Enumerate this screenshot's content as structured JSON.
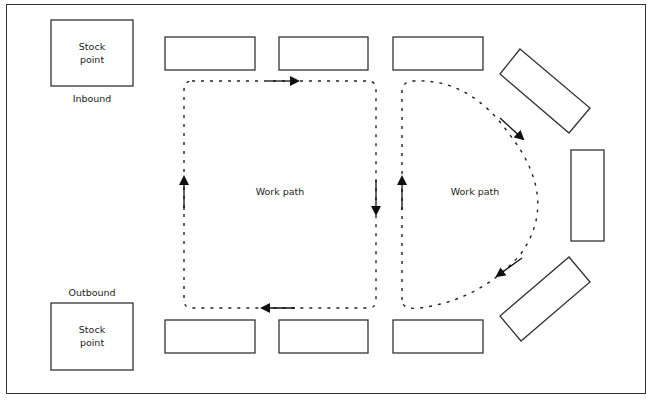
{
  "diagram": {
    "stock_points": [
      {
        "label_line1": "Stock",
        "label_line2": "point",
        "caption": "Inbound"
      },
      {
        "label_line1": "Stock",
        "label_line2": "point",
        "caption": "Outbound"
      }
    ],
    "work_paths": [
      {
        "label": "Work path",
        "shape": "rectangular loop",
        "direction": "clockwise"
      },
      {
        "label": "Work path",
        "shape": "D-shaped loop",
        "direction": "clockwise"
      }
    ],
    "workstations": {
      "top_row_count": 3,
      "bottom_row_count": 3,
      "right_arc_count": 3
    },
    "colors": {
      "line": "#333333",
      "background": "#ffffff"
    }
  }
}
